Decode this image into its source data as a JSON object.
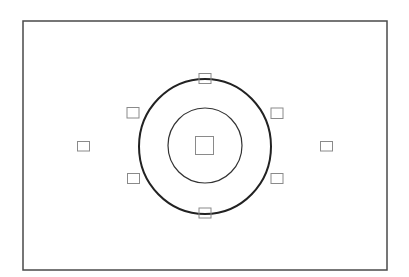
{
  "diagram": {
    "type": "viewfinder-af-layout",
    "colors": {
      "background": "#ffffff",
      "frame": "#4a4a4a",
      "spot_circle": "#222222",
      "center_circle": "#333333",
      "af_point": "#8a8a8a"
    },
    "frame": {
      "x": 23,
      "y": 21,
      "width": 364,
      "height": 249,
      "stroke_width": 1.5
    },
    "circles": [
      {
        "name": "metering-circle-outer",
        "cx": 205,
        "cy": 146.5,
        "rx": 66,
        "ry": 67.5,
        "stroke_width": 2
      },
      {
        "name": "metering-circle-inner",
        "cx": 205,
        "cy": 145.5,
        "rx": 37,
        "ry": 37.5,
        "stroke_width": 1.2
      }
    ],
    "af_points": [
      {
        "name": "af-point-center",
        "x": 195.5,
        "y": 136.5,
        "width": 18,
        "height": 18
      },
      {
        "name": "af-point-top",
        "x": 199,
        "y": 73.5,
        "width": 12,
        "height": 10
      },
      {
        "name": "af-point-bottom",
        "x": 199,
        "y": 208,
        "width": 12,
        "height": 10
      },
      {
        "name": "af-point-left",
        "x": 77.5,
        "y": 141.5,
        "width": 12,
        "height": 9.5
      },
      {
        "name": "af-point-right",
        "x": 320.5,
        "y": 141.5,
        "width": 12,
        "height": 9.5
      },
      {
        "name": "af-point-upper-left",
        "x": 127,
        "y": 107.5,
        "width": 12,
        "height": 10.5
      },
      {
        "name": "af-point-upper-right",
        "x": 271,
        "y": 108,
        "width": 12,
        "height": 10.5
      },
      {
        "name": "af-point-lower-left",
        "x": 127.5,
        "y": 173.5,
        "width": 12,
        "height": 10
      },
      {
        "name": "af-point-lower-right",
        "x": 271,
        "y": 173.5,
        "width": 12,
        "height": 10
      }
    ]
  }
}
